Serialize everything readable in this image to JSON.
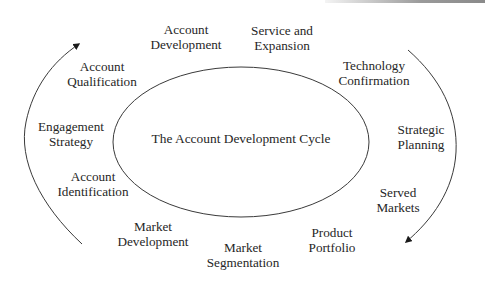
{
  "diagram": {
    "title": "The Account Development Cycle",
    "colors": {
      "line": "#3a3a3a",
      "text": "#262626",
      "background": "#ffffff"
    },
    "stages": [
      {
        "id": "account-development",
        "lines": [
          "Account",
          "Development"
        ],
        "x": 186,
        "y": 37
      },
      {
        "id": "service-expansion",
        "lines": [
          "Service and",
          "Expansion"
        ],
        "x": 282,
        "y": 38
      },
      {
        "id": "technology-confirmation",
        "lines": [
          "Technology",
          "Confirmation"
        ],
        "x": 374,
        "y": 73
      },
      {
        "id": "strategic-planning",
        "lines": [
          "Strategic",
          "Planning"
        ],
        "x": 421,
        "y": 137
      },
      {
        "id": "served-markets",
        "lines": [
          "Served",
          "Markets"
        ],
        "x": 398,
        "y": 200
      },
      {
        "id": "product-portfolio",
        "lines": [
          "Product",
          "Portfolio"
        ],
        "x": 332,
        "y": 240
      },
      {
        "id": "market-segmentation",
        "lines": [
          "Market",
          "Segmentation"
        ],
        "x": 243,
        "y": 255
      },
      {
        "id": "market-development",
        "lines": [
          "Market",
          "Development"
        ],
        "x": 153,
        "y": 234
      },
      {
        "id": "account-identification",
        "lines": [
          "Account",
          "Identification"
        ],
        "x": 93,
        "y": 184
      },
      {
        "id": "engagement-strategy",
        "lines": [
          "Engagement",
          "Strategy"
        ],
        "x": 71,
        "y": 134
      },
      {
        "id": "account-qualification",
        "lines": [
          "Account",
          "Qualification"
        ],
        "x": 102,
        "y": 74
      }
    ],
    "arrows": [
      {
        "id": "left-arrow",
        "direction": "up (clockwise flow)"
      },
      {
        "id": "right-arrow",
        "direction": "down (clockwise flow)"
      }
    ]
  }
}
